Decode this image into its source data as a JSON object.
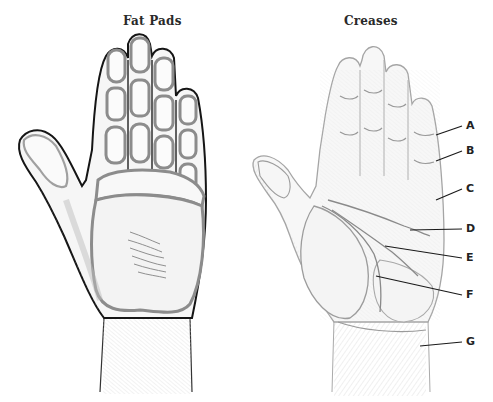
{
  "figures": [
    {
      "title": "Fat Pads",
      "subject": "palm-fat-pads"
    },
    {
      "title": "Creases",
      "subject": "palm-creases",
      "callouts": [
        {
          "label": "A",
          "line": [
            436,
            135,
            462,
            126
          ],
          "text_pos": [
            466,
            120
          ]
        },
        {
          "label": "B",
          "line": [
            436,
            161,
            462,
            151
          ],
          "text_pos": [
            466,
            145
          ]
        },
        {
          "label": "C",
          "line": [
            436,
            200,
            462,
            189
          ],
          "text_pos": [
            466,
            182
          ]
        },
        {
          "label": "D",
          "line": [
            410,
            230,
            462,
            229
          ],
          "text_pos": [
            466,
            222
          ]
        },
        {
          "label": "E",
          "line": [
            385,
            246,
            462,
            258
          ],
          "text_pos": [
            466,
            251
          ]
        },
        {
          "label": "F",
          "line": [
            376,
            276,
            462,
            295
          ],
          "text_pos": [
            466,
            289
          ]
        },
        {
          "label": "G",
          "line": [
            420,
            346,
            462,
            342
          ],
          "text_pos": [
            466,
            336
          ]
        }
      ]
    }
  ],
  "colors": {
    "outline": "#1a1a1a",
    "pad_stroke": "#8c8c8c",
    "sketch": "#9a9a9a",
    "label": "#222222",
    "background": "#ffffff"
  }
}
